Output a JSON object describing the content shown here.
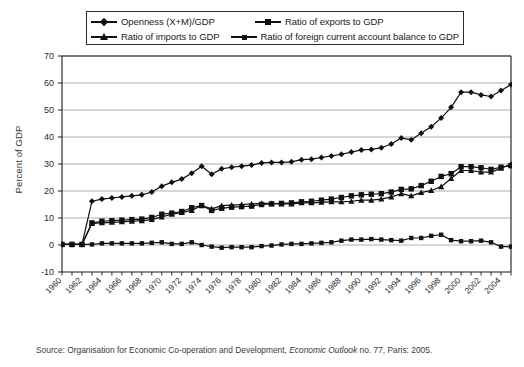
{
  "legend": {
    "entries": [
      {
        "label": "Openness (X+M)/GDP",
        "marker": "diamond"
      },
      {
        "label": "Ratio of exports to GDP",
        "marker": "square"
      },
      {
        "label": "Ratio of imports to GDP",
        "marker": "triangle"
      },
      {
        "label": "Ratio of foreign current account balance to GDP",
        "marker": "small-square"
      }
    ]
  },
  "source": {
    "prefix": "Source: Organisation for Economic Co-operation and Development, ",
    "italic": "Economic Outlook",
    "suffix": " no. 77, Paris: 2005."
  },
  "colors": {
    "line": "#111111",
    "grid": "#9a9a9a",
    "axis": "#1a1a1a",
    "background": "#ffffff"
  },
  "chart_data": {
    "type": "line",
    "title": "",
    "xlabel": "",
    "ylabel": "Percent of GDP",
    "ylim": [
      -10,
      70
    ],
    "yticks": [
      -10,
      0,
      10,
      20,
      30,
      40,
      50,
      60,
      70
    ],
    "grid": true,
    "legend_position": "top",
    "x": [
      1960,
      1961,
      1962,
      1963,
      1964,
      1965,
      1966,
      1967,
      1968,
      1969,
      1970,
      1971,
      1972,
      1973,
      1974,
      1975,
      1976,
      1977,
      1978,
      1979,
      1980,
      1981,
      1982,
      1983,
      1984,
      1985,
      1986,
      1987,
      1988,
      1989,
      1990,
      1991,
      1992,
      1993,
      1994,
      1995,
      1996,
      1997,
      1998,
      1999,
      2000,
      2001,
      2002,
      2003,
      2004,
      2005
    ],
    "xticks": [
      1960,
      1962,
      1964,
      1966,
      1968,
      1970,
      1972,
      1974,
      1976,
      1978,
      1980,
      1982,
      1984,
      1986,
      1988,
      1990,
      1992,
      1994,
      1996,
      1998,
      2000,
      2002,
      2004
    ],
    "series": [
      {
        "name": "Openness (X+M)/GDP",
        "marker": "diamond",
        "values": [
          0.2,
          0.2,
          0.2,
          16.2,
          17.0,
          17.4,
          17.8,
          18.2,
          18.6,
          19.6,
          21.8,
          23.2,
          24.4,
          26.6,
          29.2,
          26.2,
          28.2,
          28.8,
          29.2,
          29.6,
          30.4,
          30.6,
          30.6,
          30.8,
          31.6,
          31.8,
          32.4,
          33.0,
          33.6,
          34.4,
          35.2,
          35.4,
          36.0,
          37.4,
          39.6,
          39.0,
          41.4,
          43.8,
          47.0,
          51.0,
          56.6,
          56.6,
          55.6,
          55.0,
          57.2,
          59.4
        ]
      },
      {
        "name": "Ratio of exports to GDP",
        "marker": "square",
        "values": [
          0.2,
          0.2,
          0.2,
          8.2,
          8.8,
          9.0,
          9.2,
          9.4,
          9.6,
          10.2,
          11.4,
          11.8,
          12.4,
          13.8,
          14.6,
          12.8,
          13.6,
          14.0,
          14.2,
          14.4,
          15.0,
          15.2,
          15.4,
          15.6,
          16.0,
          16.2,
          16.6,
          17.0,
          17.6,
          18.2,
          18.6,
          18.8,
          19.0,
          19.6,
          20.6,
          20.8,
          22.0,
          23.6,
          25.4,
          26.4,
          29.0,
          29.0,
          28.6,
          28.0,
          28.8,
          29.4
        ]
      },
      {
        "name": "Ratio of imports to GDP",
        "marker": "triangle",
        "values": [
          0.2,
          0.2,
          0.2,
          8.0,
          8.2,
          8.4,
          8.6,
          8.8,
          9.0,
          9.4,
          10.4,
          11.4,
          12.0,
          12.8,
          14.6,
          13.4,
          14.6,
          14.8,
          15.0,
          15.2,
          15.4,
          15.4,
          15.2,
          15.2,
          15.6,
          15.6,
          15.8,
          16.0,
          16.0,
          16.2,
          16.6,
          16.6,
          17.0,
          17.8,
          19.0,
          18.2,
          19.4,
          20.2,
          21.6,
          24.6,
          27.6,
          27.6,
          27.0,
          27.0,
          28.4,
          30.0
        ]
      },
      {
        "name": "Ratio of foreign current account balance to GDP",
        "marker": "small-square",
        "values": [
          0.2,
          0.2,
          0.2,
          0.2,
          0.6,
          0.6,
          0.6,
          0.6,
          0.6,
          0.8,
          1.0,
          0.4,
          0.4,
          1.0,
          0.0,
          -0.6,
          -1.0,
          -0.8,
          -0.8,
          -0.8,
          -0.4,
          -0.2,
          0.2,
          0.4,
          0.4,
          0.6,
          0.8,
          1.0,
          1.6,
          2.0,
          2.0,
          2.2,
          2.0,
          1.8,
          1.6,
          2.6,
          2.6,
          3.4,
          3.8,
          1.8,
          1.4,
          1.4,
          1.6,
          1.0,
          -0.6,
          -0.6
        ]
      }
    ]
  }
}
